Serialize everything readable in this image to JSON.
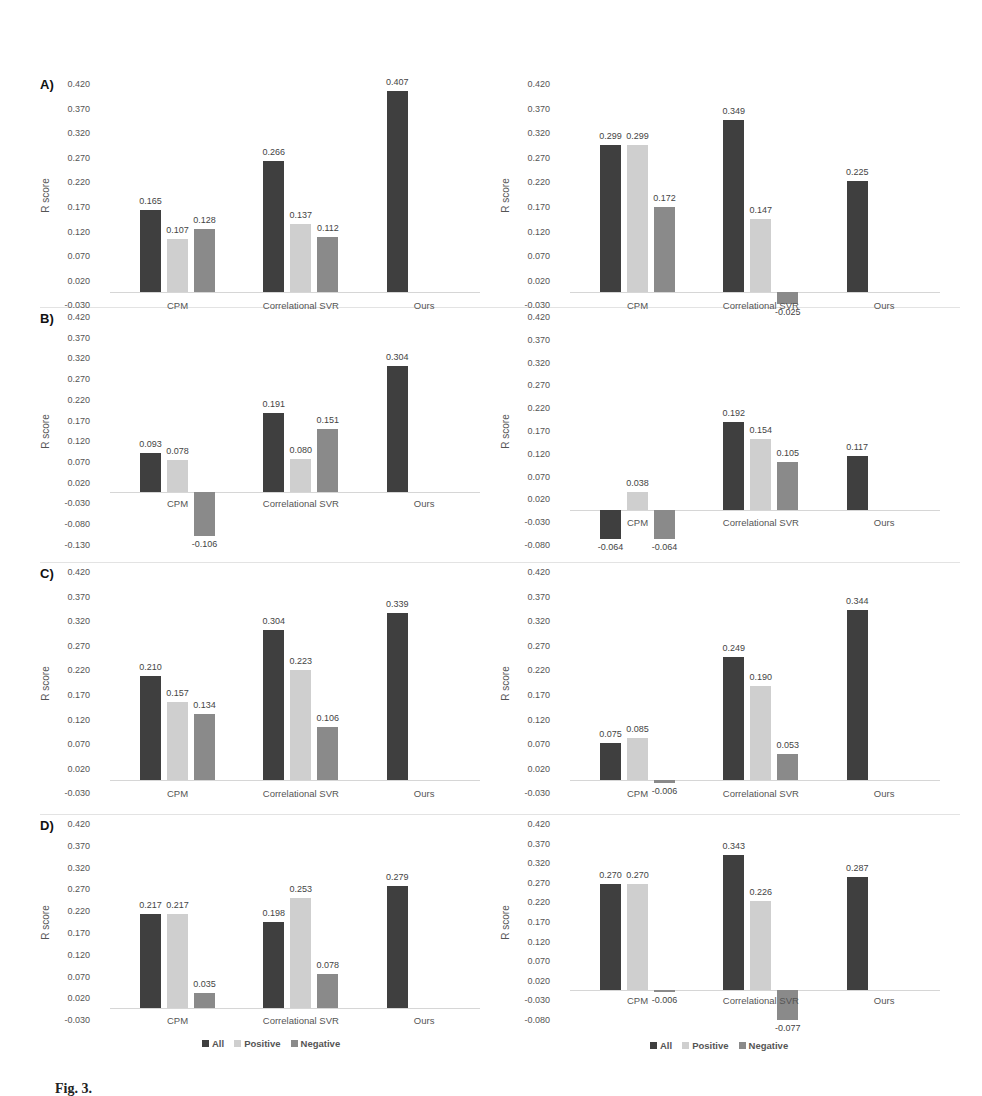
{
  "chart_data": [
    {
      "type": "bar",
      "panel": "A)",
      "side": "left",
      "categories": [
        "CPM",
        "Correlational SVR",
        "Ours"
      ],
      "series": [
        {
          "name": "All",
          "values": [
            0.165,
            0.266,
            0.407
          ]
        },
        {
          "name": "Positive",
          "values": [
            0.107,
            0.137,
            null
          ]
        },
        {
          "name": "Negative",
          "values": [
            0.128,
            0.112,
            null
          ]
        }
      ],
      "ylabel": "R score",
      "yticks": [
        "0.420",
        "0.370",
        "0.320",
        "0.270",
        "0.220",
        "0.170",
        "0.120",
        "0.070",
        "0.020",
        "-0.030"
      ],
      "ylim": [
        -0.03,
        0.42
      ]
    },
    {
      "type": "bar",
      "panel": "",
      "side": "right",
      "categories": [
        "CPM",
        "Correlational SVR",
        "Ours"
      ],
      "series": [
        {
          "name": "All",
          "values": [
            0.299,
            0.349,
            0.225
          ]
        },
        {
          "name": "Positive",
          "values": [
            0.299,
            0.147,
            null
          ]
        },
        {
          "name": "Negative",
          "values": [
            0.172,
            -0.025,
            null
          ]
        }
      ],
      "ylabel": "R score",
      "yticks": [
        "0.420",
        "0.370",
        "0.320",
        "0.270",
        "0.220",
        "0.170",
        "0.120",
        "0.070",
        "0.020",
        "-0.030"
      ],
      "ylim": [
        -0.03,
        0.42
      ]
    },
    {
      "type": "bar",
      "panel": "B)",
      "side": "left",
      "categories": [
        "CPM",
        "Correlational SVR",
        "Ours"
      ],
      "series": [
        {
          "name": "All",
          "values": [
            0.093,
            0.191,
            0.304
          ]
        },
        {
          "name": "Positive",
          "values": [
            0.078,
            0.08,
            null
          ]
        },
        {
          "name": "Negative",
          "values": [
            -0.106,
            0.151,
            null
          ]
        }
      ],
      "ylabel": "R score",
      "yticks": [
        "0.420",
        "0.370",
        "0.320",
        "0.270",
        "0.220",
        "0.170",
        "0.120",
        "0.070",
        "0.020",
        "-0.030",
        "-0.080",
        "-0.130"
      ],
      "ylim": [
        -0.13,
        0.42
      ]
    },
    {
      "type": "bar",
      "panel": "",
      "side": "right",
      "categories": [
        "CPM",
        "Correlational SVR",
        "Ours"
      ],
      "series": [
        {
          "name": "All",
          "values": [
            -0.064,
            0.192,
            0.117
          ]
        },
        {
          "name": "Positive",
          "values": [
            0.038,
            0.154,
            null
          ]
        },
        {
          "name": "Negative",
          "values": [
            -0.064,
            0.105,
            null
          ]
        }
      ],
      "ylabel": "R score",
      "yticks": [
        "0.420",
        "0.370",
        "0.320",
        "0.270",
        "0.220",
        "0.170",
        "0.120",
        "0.070",
        "0.020",
        "-0.030",
        "-0.080"
      ],
      "ylim": [
        -0.08,
        0.42
      ]
    },
    {
      "type": "bar",
      "panel": "C)",
      "side": "left",
      "categories": [
        "CPM",
        "Correlational SVR",
        "Ours"
      ],
      "series": [
        {
          "name": "All",
          "values": [
            0.21,
            0.304,
            0.339
          ]
        },
        {
          "name": "Positive",
          "values": [
            0.157,
            0.223,
            null
          ]
        },
        {
          "name": "Negative",
          "values": [
            0.134,
            0.106,
            null
          ]
        }
      ],
      "ylabel": "R score",
      "yticks": [
        "0.420",
        "0.370",
        "0.320",
        "0.270",
        "0.220",
        "0.170",
        "0.120",
        "0.070",
        "0.020",
        "-0.030"
      ],
      "ylim": [
        -0.03,
        0.42
      ]
    },
    {
      "type": "bar",
      "panel": "",
      "side": "right",
      "categories": [
        "CPM",
        "Correlational SVR",
        "Ours"
      ],
      "series": [
        {
          "name": "All",
          "values": [
            0.075,
            0.249,
            0.344
          ]
        },
        {
          "name": "Positive",
          "values": [
            0.085,
            0.19,
            null
          ]
        },
        {
          "name": "Negative",
          "values": [
            -0.006,
            0.053,
            null
          ]
        }
      ],
      "ylabel": "R score",
      "yticks": [
        "0.420",
        "0.370",
        "0.320",
        "0.270",
        "0.220",
        "0.170",
        "0.120",
        "0.070",
        "0.020",
        "-0.030"
      ],
      "ylim": [
        -0.03,
        0.42
      ]
    },
    {
      "type": "bar",
      "panel": "D)",
      "side": "left",
      "categories": [
        "CPM",
        "Correlational SVR",
        "Ours"
      ],
      "series": [
        {
          "name": "All",
          "values": [
            0.217,
            0.198,
            0.279
          ]
        },
        {
          "name": "Positive",
          "values": [
            0.217,
            0.253,
            null
          ]
        },
        {
          "name": "Negative",
          "values": [
            0.035,
            0.078,
            null
          ]
        }
      ],
      "ylabel": "R score",
      "yticks": [
        "0.420",
        "0.370",
        "0.320",
        "0.270",
        "0.220",
        "0.170",
        "0.120",
        "0.070",
        "0.020",
        "-0.030"
      ],
      "ylim": [
        -0.03,
        0.42
      ],
      "legend": [
        "All",
        "Positive",
        "Negative"
      ]
    },
    {
      "type": "bar",
      "panel": "",
      "side": "right",
      "categories": [
        "CPM",
        "Correlational SVR",
        "Ours"
      ],
      "series": [
        {
          "name": "All",
          "values": [
            0.27,
            0.343,
            0.287
          ]
        },
        {
          "name": "Positive",
          "values": [
            0.27,
            0.226,
            null
          ]
        },
        {
          "name": "Negative",
          "values": [
            -0.006,
            -0.077,
            null
          ]
        }
      ],
      "ylabel": "R score",
      "yticks": [
        "0.420",
        "0.370",
        "0.320",
        "0.270",
        "0.220",
        "0.170",
        "0.120",
        "0.070",
        "0.020",
        "-0.030",
        "-0.080"
      ],
      "ylim": [
        -0.08,
        0.42
      ],
      "legend": [
        "All",
        "Positive",
        "Negative"
      ]
    }
  ],
  "legend": {
    "items": [
      {
        "label": "All",
        "color": "#3f3f3f"
      },
      {
        "label": "Positive",
        "color": "#cfcfcf"
      },
      {
        "label": "Negative",
        "color": "#8a8a8a"
      }
    ]
  },
  "caption": {
    "text": "Fig. 3."
  }
}
